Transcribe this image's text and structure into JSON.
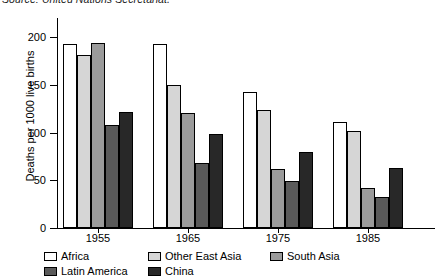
{
  "source_note": "Source: United Nations Secretariat.",
  "chart_data": {
    "type": "bar",
    "title": "",
    "xlabel": "",
    "ylabel": "Deaths per 1000 live births",
    "ylim": [
      0,
      200
    ],
    "yticks": [
      0,
      50,
      100,
      150,
      200
    ],
    "grid": false,
    "legend_position": "bottom-left",
    "categories": [
      "1955",
      "1965",
      "1975",
      "1985"
    ],
    "series": [
      {
        "name": "Africa",
        "color": "#ffffff",
        "values": [
          193,
          193,
          142,
          111
        ]
      },
      {
        "name": "Other East Asia",
        "color": "#d6d6d6",
        "values": [
          181,
          150,
          124,
          102
        ]
      },
      {
        "name": "South Asia",
        "color": "#9b9b9b",
        "values": [
          194,
          120,
          62,
          42
        ]
      },
      {
        "name": "Latin America",
        "color": "#5a5a5a",
        "values": [
          108,
          68,
          49,
          33
        ]
      },
      {
        "name": "China",
        "color": "#282828",
        "values": [
          122,
          98,
          80,
          63
        ]
      }
    ]
  }
}
